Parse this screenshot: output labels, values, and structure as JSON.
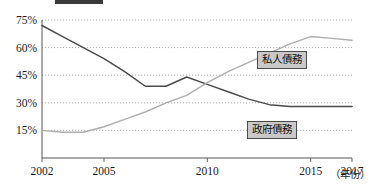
{
  "chart_data": {
    "type": "line",
    "title": "",
    "xlabel": "（年份）",
    "ylabel": "",
    "xlim": [
      2002,
      2017
    ],
    "ylim": [
      0,
      75
    ],
    "grid": true,
    "legend_position": "inline-near-series",
    "x": [
      2002,
      2003,
      2004,
      2005,
      2006,
      2007,
      2008,
      2009,
      2010,
      2011,
      2012,
      2013,
      2014,
      2015,
      2016,
      2017
    ],
    "y_ticks": [
      15,
      30,
      45,
      60,
      75
    ],
    "y_tick_labels": [
      "15%",
      "30%",
      "45%",
      "60%",
      "75%"
    ],
    "x_ticks": [
      2002,
      2005,
      2010,
      2015,
      2017
    ],
    "x_tick_labels": [
      "2002",
      "2005",
      "2010",
      "2015",
      "2017"
    ],
    "series": [
      {
        "name": "政府債務",
        "color": "#4a4a4a",
        "values": [
          72,
          66,
          60,
          54,
          47,
          39,
          39,
          44,
          40,
          36,
          32,
          29,
          28,
          28,
          28,
          28
        ]
      },
      {
        "name": "私人債務",
        "color": "#aeaeae",
        "values": [
          15,
          14,
          14,
          17,
          21,
          25,
          30,
          34,
          41,
          47,
          52,
          57,
          62,
          66,
          65,
          64
        ]
      }
    ]
  },
  "legend": {
    "private_label": "私人債務",
    "government_label": "政府債務"
  },
  "axis": {
    "x_caption": "（年份）"
  }
}
